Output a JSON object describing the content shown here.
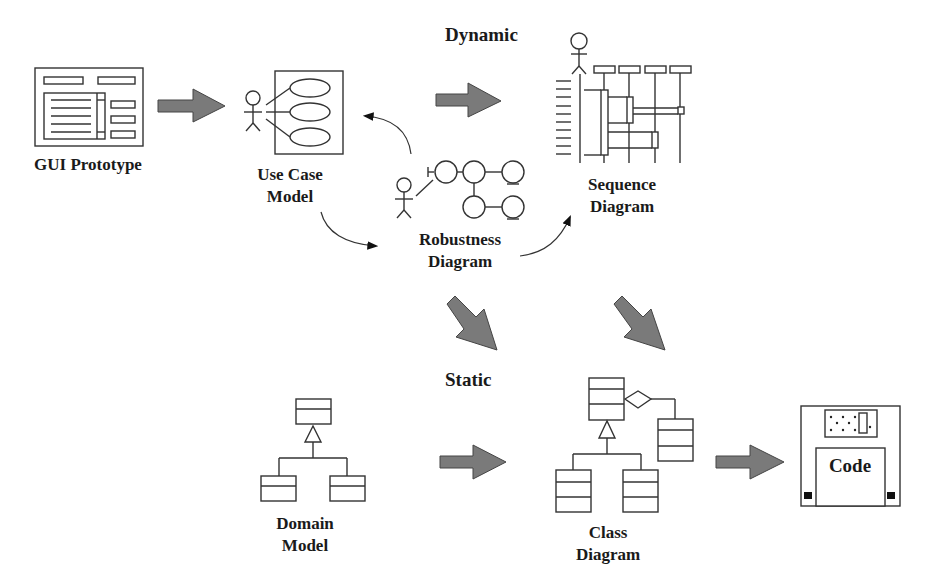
{
  "sections": {
    "dynamic": "Dynamic",
    "static": "Static"
  },
  "nodes": {
    "gui_prototype": {
      "line1": "GUI Prototype"
    },
    "use_case_model": {
      "line1": "Use Case",
      "line2": "Model"
    },
    "robustness_diagram": {
      "line1": "Robustness",
      "line2": "Diagram"
    },
    "sequence_diagram": {
      "line1": "Sequence",
      "line2": "Diagram"
    },
    "domain_model": {
      "line1": "Domain",
      "line2": "Model"
    },
    "class_diagram": {
      "line1": "Class",
      "line2": "Diagram"
    },
    "code": {
      "line1": "Code"
    }
  },
  "edges": [
    {
      "from": "gui_prototype",
      "to": "use_case_model",
      "style": "block-arrow"
    },
    {
      "from": "use_case_model",
      "to": "robustness_diagram",
      "style": "curved-arrow"
    },
    {
      "from": "robustness_diagram",
      "to": "use_case_model",
      "style": "curved-arrow"
    },
    {
      "from": "robustness_diagram",
      "to": "sequence_diagram",
      "style": "curved-arrow"
    },
    {
      "from": "use_case_model",
      "to": "sequence_diagram",
      "style": "block-arrow"
    },
    {
      "from": "robustness_diagram",
      "to": "class_diagram",
      "style": "block-arrow"
    },
    {
      "from": "sequence_diagram",
      "to": "class_diagram",
      "style": "block-arrow"
    },
    {
      "from": "domain_model",
      "to": "class_diagram",
      "style": "block-arrow"
    },
    {
      "from": "class_diagram",
      "to": "code",
      "style": "block-arrow"
    }
  ],
  "colors": {
    "block_arrow_fill": "#7a7a7a",
    "stroke": "#333333",
    "text": "#1a1a1a"
  }
}
